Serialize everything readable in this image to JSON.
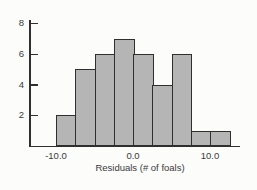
{
  "chart_data": {
    "type": "bar",
    "subtype": "histogram",
    "title": "",
    "xlabel": "Residuals (# of foals)",
    "ylabel": "",
    "bins": {
      "start": -10,
      "width": 2.5,
      "counts": [
        2,
        5,
        6,
        7,
        6,
        4,
        6,
        1,
        1
      ]
    },
    "bin_edges": [
      -10,
      -7.5,
      -5,
      -2.5,
      0,
      2.5,
      5,
      7.5,
      10,
      12.5
    ],
    "x_ticks": [
      {
        "value": -10,
        "label": "-10.0"
      },
      {
        "value": 0,
        "label": "0.0"
      },
      {
        "value": 10,
        "label": "10.0"
      }
    ],
    "y_ticks": [
      2,
      4,
      6,
      8
    ],
    "xlim": [
      -13.5,
      14
    ],
    "ylim": [
      0,
      8.2
    ],
    "grid": false,
    "legend": null,
    "colors": {
      "bar_fill": "#b5b5b5",
      "bar_border": "#2f2f2f",
      "axis": "#2f2f2f",
      "text": "#3a3a3a",
      "background": "#fcfcfa"
    }
  }
}
